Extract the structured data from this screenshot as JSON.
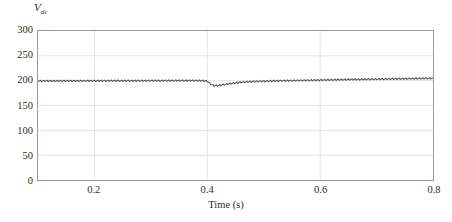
{
  "chart_data": {
    "type": "line",
    "title": "",
    "xlabel": "Time (s)",
    "ylabel": "Vdc",
    "ylabel_main": "V",
    "ylabel_sub": "dc",
    "xlim": [
      0.1,
      0.8
    ],
    "ylim": [
      0,
      300
    ],
    "grid": true,
    "legend": null,
    "xticks": [
      0.2,
      0.4,
      0.6,
      0.8
    ],
    "xtick_labels": [
      "0.2",
      "0.4",
      "0.6",
      "0.8"
    ],
    "yticks": [
      0,
      50,
      100,
      150,
      200,
      250,
      300
    ],
    "ytick_labels": [
      "0",
      "50",
      "100",
      "150",
      "200",
      "250",
      "300"
    ],
    "line_color": "#555555",
    "grid_color": "#e3e3e3",
    "frame_color": "#9a9a9a",
    "series": [
      {
        "name": "Vdc",
        "description": "DC link voltage regulated at 200 V with small high-frequency ripple; transient sag to about 190 V at t = 0.40 s, recovering and settling slightly above 200 V, drifting to about 205 V at t = 0.80 s",
        "ripple_amplitude": 1.5,
        "ripple_period": 0.006,
        "x": [
          0.1,
          0.12,
          0.14,
          0.16,
          0.18,
          0.2,
          0.22,
          0.24,
          0.26,
          0.28,
          0.3,
          0.32,
          0.34,
          0.36,
          0.38,
          0.39,
          0.4,
          0.405,
          0.41,
          0.415,
          0.42,
          0.43,
          0.44,
          0.45,
          0.46,
          0.47,
          0.48,
          0.5,
          0.52,
          0.54,
          0.56,
          0.58,
          0.6,
          0.62,
          0.64,
          0.66,
          0.68,
          0.7,
          0.72,
          0.74,
          0.76,
          0.78,
          0.8
        ],
        "y": [
          199.5,
          199.6,
          199.6,
          199.7,
          199.7,
          199.8,
          199.8,
          199.9,
          199.9,
          200.0,
          200.0,
          200.1,
          200.1,
          200.2,
          200.2,
          200.1,
          199.0,
          194.0,
          190.5,
          189.8,
          190.5,
          192.0,
          194.0,
          195.5,
          196.8,
          197.6,
          198.2,
          199.0,
          199.6,
          200.0,
          200.4,
          200.8,
          201.2,
          201.6,
          202.0,
          202.4,
          202.7,
          203.1,
          203.4,
          203.8,
          204.1,
          204.5,
          204.8
        ]
      }
    ]
  }
}
